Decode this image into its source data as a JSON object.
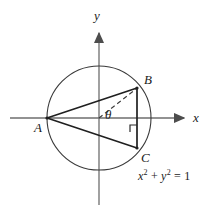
{
  "figure": {
    "background_color": "#ffffff",
    "stroke_color": "#262626",
    "axis_color": "#6b6b6b",
    "axes": {
      "x_label": "x",
      "y_label": "y",
      "x_axis": {
        "x1": 10,
        "y1": 118,
        "x2": 188,
        "y2": 118
      },
      "y_axis": {
        "x1": 99,
        "y1": 28,
        "x2": 99,
        "y2": 206
      }
    },
    "circle": {
      "center_x": 99,
      "center_y": 118,
      "radius": 52,
      "equation": "x² + y² = 1",
      "equation_parts": {
        "lhs_x": "x",
        "lhs_y": "y",
        "exponent": "2",
        "plus": "+",
        "equals": "=",
        "rhs": "1"
      }
    },
    "points": [
      {
        "name": "A",
        "label": "A",
        "x": 47,
        "y": 118
      },
      {
        "name": "B",
        "label": "B",
        "x": 137,
        "y": 88
      },
      {
        "name": "C",
        "label": "C",
        "x": 137,
        "y": 148
      },
      {
        "name": "O",
        "label": "",
        "x": 99,
        "y": 118
      }
    ],
    "segments": [
      {
        "name": "segment-AB",
        "from": "A",
        "to": "B",
        "style": "solid"
      },
      {
        "name": "segment-AC",
        "from": "A",
        "to": "C",
        "style": "solid"
      },
      {
        "name": "segment-BC",
        "from": "B",
        "to": "C",
        "style": "solid"
      },
      {
        "name": "radius-OB",
        "from": "O",
        "to": "B",
        "style": "dashed"
      }
    ],
    "angle": {
      "label": "θ",
      "vertex": "O",
      "from_ray": "positive-x-axis",
      "to_ray": "radius-OB"
    },
    "right_angle_marker": {
      "x": 137,
      "y": 118,
      "size": 7
    }
  }
}
